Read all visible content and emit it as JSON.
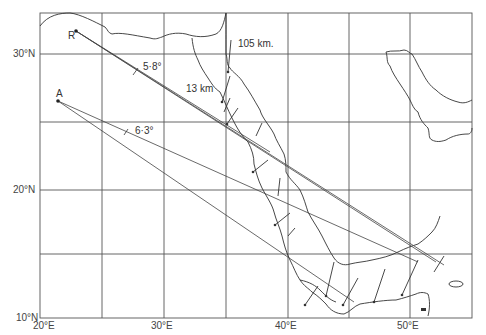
{
  "figure": {
    "type": "map",
    "region": "Red Sea and Gulf of Aden",
    "colors": {
      "ink": "#333333",
      "grid": "#555555",
      "paper": "#ffffff"
    }
  },
  "axes": {
    "latitude_labels": [
      {
        "label": "30°N",
        "y": 54
      },
      {
        "label": "20°N",
        "y": 190
      },
      {
        "label": "10°N",
        "y": 318
      }
    ],
    "longitude_labels": [
      {
        "label": "20°E",
        "x": 40
      },
      {
        "label": "30°E",
        "x": 164
      },
      {
        "label": "40°E",
        "x": 288
      },
      {
        "label": "50°E",
        "x": 410
      }
    ],
    "grid_x": [
      40,
      102,
      164,
      226,
      288,
      349,
      410,
      472
    ],
    "grid_y": [
      13,
      54,
      122,
      190,
      254,
      318
    ]
  },
  "points": [
    {
      "id": "R",
      "label": "R",
      "x": 76,
      "y": 31
    },
    {
      "id": "A",
      "label": "A",
      "x": 58,
      "y": 101
    }
  ],
  "annotations": {
    "angle_R": "5·8°",
    "angle_A": "6·3°",
    "dist_north": "105 km.",
    "dist_gulf": "13 km"
  }
}
